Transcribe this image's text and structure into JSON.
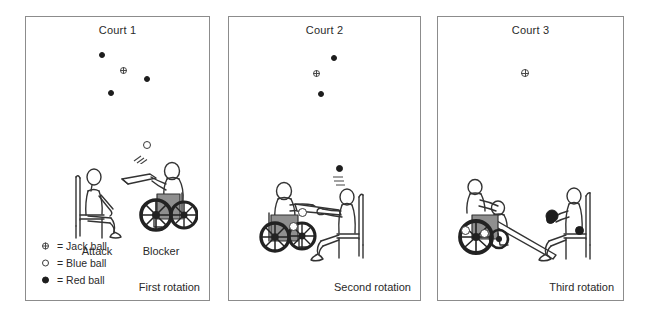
{
  "figure": {
    "type": "diagram",
    "panels": [
      {
        "id": "court-1",
        "title": "Court 1",
        "rotation_label": "First rotation",
        "player_labels": {
          "left": "Attack",
          "right": "Blocker"
        },
        "balls": [
          {
            "kind": "red",
            "x": 76,
            "y": 38
          },
          {
            "kind": "jack",
            "x": 97,
            "y": 53
          },
          {
            "kind": "red",
            "x": 121,
            "y": 62
          },
          {
            "kind": "red",
            "x": 85,
            "y": 76
          },
          {
            "kind": "blue",
            "x": 121,
            "y": 128
          }
        ]
      },
      {
        "id": "court-2",
        "title": "Court 2",
        "rotation_label": "Second rotation",
        "player_labels": {
          "left": "",
          "right": ""
        },
        "balls": [
          {
            "kind": "red",
            "x": 105,
            "y": 41
          },
          {
            "kind": "jack",
            "x": 87,
            "y": 56
          },
          {
            "kind": "red",
            "x": 92,
            "y": 77
          },
          {
            "kind": "red",
            "x": 110,
            "y": 151
          },
          {
            "kind": "blue",
            "x": 73,
            "y": 195
          },
          {
            "kind": "blue",
            "x": 64,
            "y": 209
          }
        ]
      },
      {
        "id": "court-3",
        "title": "Court 3",
        "rotation_label": "Third rotation",
        "player_labels": {
          "left": "",
          "right": ""
        },
        "balls": [
          {
            "kind": "jack",
            "x": 86,
            "y": 55
          },
          {
            "kind": "blue",
            "x": 27,
            "y": 213
          },
          {
            "kind": "blue",
            "x": 46,
            "y": 216
          },
          {
            "kind": "red",
            "x": 112,
            "y": 202
          },
          {
            "kind": "red",
            "x": 141,
            "y": 213
          }
        ]
      }
    ]
  },
  "legend": {
    "items": [
      {
        "symbol": "jack",
        "text": "= Jack ball"
      },
      {
        "symbol": "blue",
        "text": "= Blue ball"
      },
      {
        "symbol": "red",
        "text": "= Red ball"
      }
    ]
  },
  "colors": {
    "ball_red": "#1d1d1d",
    "ball_blue_fill": "#ffffff",
    "ball_outline": "#3a3a3a",
    "panel_border": "#8c8c8c",
    "text": "#2a2a2a",
    "figure_stroke": "#333333",
    "wheelchair_seat": "#8f8f8f"
  }
}
